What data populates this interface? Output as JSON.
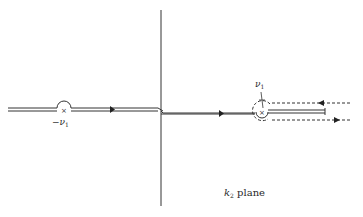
{
  "figure": {
    "plane_label": {
      "var": "k",
      "sub": "2",
      "text": "plane"
    },
    "poles": [
      {
        "label_sign": "−",
        "label_var": "ν",
        "label_sub": "1",
        "x": 64,
        "y": 110
      },
      {
        "label_sign": "",
        "label_var": "ν",
        "label_sub": "1",
        "x": 262,
        "y": 112
      }
    ],
    "colors": {
      "ink": "#2a2a2a",
      "background": "#ffffff"
    }
  }
}
